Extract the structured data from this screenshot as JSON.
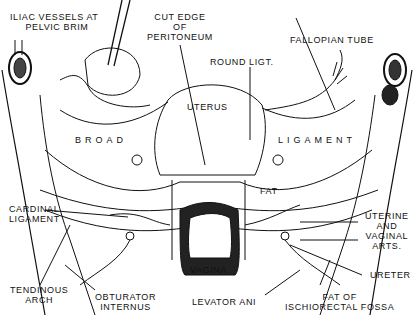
{
  "figure": {
    "type": "anatomical line drawing",
    "labels": {
      "iliac": "ILIAC VESSELS AT\n     PELVIC BRIM",
      "cut_edge": "CUT EDGE\nOF\nPERITONEUM",
      "fallopian": "FALLOPIAN TUBE",
      "round_ligt": "ROUND LIGT.",
      "uterus": "UTERUS",
      "broad": "BROAD",
      "ligament": "LIGAMENT",
      "fat": "FAT",
      "cardinal": "CARDINAL\nLIGAMENT",
      "uterine_vaginal": "UTERINE\nAND\nVAGINAL\nARTS.",
      "vagina": "VAGINA",
      "ureter": "URETER",
      "tendinous": "TENDINOUS\nARCH",
      "obturator": "OBTURATOR\nINTERNUS",
      "levator": "LEVATOR ANI",
      "fat_fossa": "FAT OF\nISCHIORECTAL FOSSA"
    },
    "colors": {
      "ink": "#111111",
      "background": "#ffffff"
    }
  }
}
